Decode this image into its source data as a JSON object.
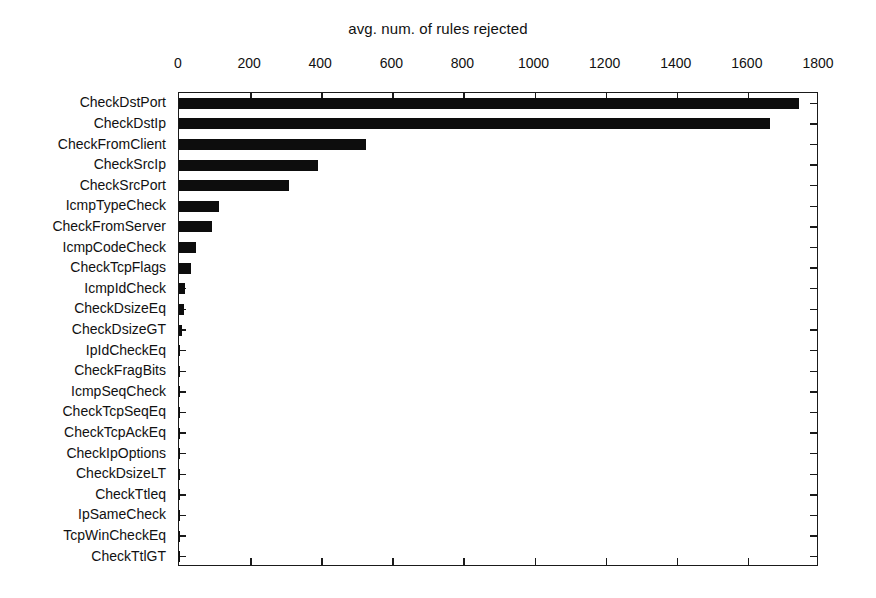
{
  "chart_data": {
    "type": "bar",
    "orientation": "horizontal",
    "title": "avg. num. of rules rejected",
    "xlabel": "",
    "ylabel": "",
    "xlim": [
      0,
      1800
    ],
    "xticks": [
      0,
      200,
      400,
      600,
      800,
      1000,
      1200,
      1400,
      1600,
      1800
    ],
    "xtick_labels": [
      "0",
      "200",
      "400",
      "600",
      "800",
      "1000",
      "1200",
      "1400",
      "1600",
      "1800"
    ],
    "grid": false,
    "legend": null,
    "axis_position": "top",
    "bar_color": "#0d0d0d",
    "categories": [
      "CheckDstPort",
      "CheckDstIp",
      "CheckFromClient",
      "CheckSrcIp",
      "CheckSrcPort",
      "IcmpTypeCheck",
      "CheckFromServer",
      "IcmpCodeCheck",
      "CheckTcpFlags",
      "IcmpIdCheck",
      "CheckDsizeEq",
      "CheckDsizeGT",
      "IpIdCheckEq",
      "CheckFragBits",
      "IcmpSeqCheck",
      "CheckTcpSeqEq",
      "CheckTcpAckEq",
      "CheckIpOptions",
      "CheckDsizeLT",
      "CheckTtleq",
      "IpSameCheck",
      "TcpWinCheckEq",
      "CheckTtlGT"
    ],
    "values": [
      1744,
      1662,
      526,
      391,
      310,
      113,
      93,
      48,
      34,
      18,
      14,
      8,
      3,
      3,
      2,
      2,
      2,
      1,
      1,
      1,
      1,
      1,
      1
    ]
  }
}
